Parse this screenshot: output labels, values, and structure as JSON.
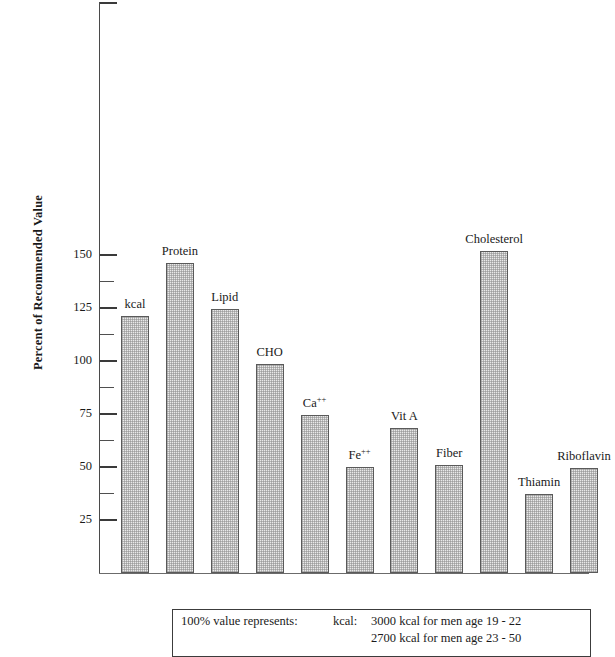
{
  "chart_data": {
    "type": "bar",
    "title": "",
    "subtitle": "",
    "xlabel": "",
    "ylabel": "Percent of Recommended Value",
    "ylim": [
      0,
      162.5
    ],
    "grid": false,
    "legend": "none",
    "y_major_ticks": [
      25,
      50,
      75,
      100,
      125,
      150
    ],
    "y_minor_ticks": [
      37.5,
      62.5,
      87.5,
      112.5,
      137.5
    ],
    "y_tick_labels": [
      "25",
      "50",
      "75",
      "100",
      "125",
      "150"
    ],
    "categories": [
      "kcal",
      "Protein",
      "Lipid",
      "CHO",
      "Ca++",
      "Fe++",
      "Vit A",
      "Fiber",
      "Cholesterol",
      "Thiamin",
      "Riboflavin"
    ],
    "values": [
      121,
      146,
      124.5,
      98.5,
      74.5,
      50,
      68.5,
      51,
      152,
      37.5,
      49.5
    ],
    "bar_labels": [
      {
        "text": "kcal",
        "sup": ""
      },
      {
        "text": "Protein",
        "sup": ""
      },
      {
        "text": "Lipid",
        "sup": ""
      },
      {
        "text": "CHO",
        "sup": ""
      },
      {
        "text": "Ca",
        "sup": "++"
      },
      {
        "text": "Fe",
        "sup": "++"
      },
      {
        "text": "Vit A",
        "sup": ""
      },
      {
        "text": "Fiber",
        "sup": ""
      },
      {
        "text": "Cholesterol",
        "sup": ""
      },
      {
        "text": "Thiamin",
        "sup": ""
      },
      {
        "text": "Riboflavin",
        "sup": ""
      }
    ],
    "bar_fill_color": "#e9e9e9",
    "bar_border_color": "#5a5a5a",
    "axis_color": "#4a4a4a"
  },
  "axis": {
    "y_title": "Percent of Recommended Value",
    "tick_labels": [
      "150",
      "125",
      "100",
      "75",
      "50",
      "25"
    ]
  },
  "caption": {
    "lead": "100% value represents:",
    "key": "kcal:",
    "line1": "3000 kcal for men age 19 - 22",
    "line2": "2700 kcal for men age 23 - 50"
  }
}
